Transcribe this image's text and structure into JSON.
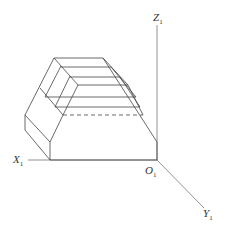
{
  "figure": {
    "type": "oblique axonometric projection of a stepped prism",
    "stroke_color": "#444444",
    "axis_color": "#777777"
  },
  "axes": {
    "x": {
      "label": "X",
      "subscript": "1"
    },
    "y": {
      "label": "Y",
      "subscript": "1"
    },
    "z": {
      "label": "Z",
      "subscript": "1"
    },
    "origin": {
      "label": "O",
      "subscript": "1"
    }
  }
}
